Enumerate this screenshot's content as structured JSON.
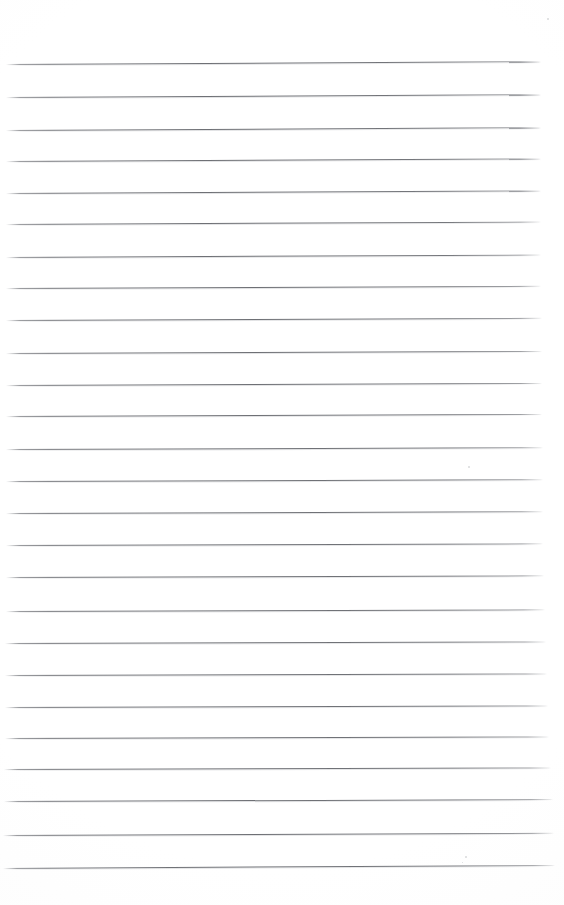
{
  "image": {
    "subject": "blank ruled notebook paper",
    "description": "Scan of an empty sheet of lined writing paper with no text or handwriting",
    "background_color": "#ffffff",
    "rule_color": "#6c6e73",
    "width": 564,
    "height": 905,
    "rule_count": 25,
    "rule_thickness_px": 1,
    "average_line_spacing_px": 32,
    "left_margin_px": 6,
    "right_edge_px": 543,
    "top_margin_px": 64,
    "bottom_margin_px": 39,
    "page_skew_degrees": -0.22,
    "has_margin_rule": false,
    "has_text": false,
    "text_content": ""
  },
  "rules": [
    {
      "index": 1,
      "y": 64,
      "x_start": 6,
      "x_end": 541,
      "skew": -0.3
    },
    {
      "index": 2,
      "y": 97,
      "x_start": 6,
      "x_end": 541,
      "skew": -0.3
    },
    {
      "index": 3,
      "y": 130,
      "x_start": 6,
      "x_end": 541,
      "skew": -0.3
    },
    {
      "index": 4,
      "y": 161,
      "x_start": 6,
      "x_end": 541,
      "skew": -0.28
    },
    {
      "index": 5,
      "y": 193,
      "x_start": 6,
      "x_end": 541,
      "skew": -0.28
    },
    {
      "index": 6,
      "y": 224,
      "x_start": 6,
      "x_end": 541,
      "skew": -0.26
    },
    {
      "index": 7,
      "y": 257,
      "x_start": 6,
      "x_end": 541,
      "skew": -0.26
    },
    {
      "index": 8,
      "y": 288,
      "x_start": 6,
      "x_end": 541,
      "skew": -0.24
    },
    {
      "index": 9,
      "y": 320,
      "x_start": 6,
      "x_end": 542,
      "skew": -0.24
    },
    {
      "index": 10,
      "y": 353,
      "x_start": 6,
      "x_end": 542,
      "skew": -0.22
    },
    {
      "index": 11,
      "y": 385,
      "x_start": 6,
      "x_end": 542,
      "skew": -0.22
    },
    {
      "index": 12,
      "y": 416,
      "x_start": 6,
      "x_end": 542,
      "skew": -0.22
    },
    {
      "index": 13,
      "y": 449,
      "x_start": 6,
      "x_end": 543,
      "skew": -0.2
    },
    {
      "index": 14,
      "y": 481,
      "x_start": 6,
      "x_end": 543,
      "skew": -0.2
    },
    {
      "index": 15,
      "y": 513,
      "x_start": 6,
      "x_end": 543,
      "skew": -0.2
    },
    {
      "index": 16,
      "y": 545,
      "x_start": 6,
      "x_end": 543,
      "skew": -0.18
    },
    {
      "index": 17,
      "y": 577,
      "x_start": 6,
      "x_end": 544,
      "skew": -0.18
    },
    {
      "index": 18,
      "y": 611,
      "x_start": 6,
      "x_end": 545,
      "skew": -0.18
    },
    {
      "index": 19,
      "y": 643,
      "x_start": 5,
      "x_end": 546,
      "skew": -0.16
    },
    {
      "index": 20,
      "y": 675,
      "x_start": 5,
      "x_end": 547,
      "skew": -0.16
    },
    {
      "index": 21,
      "y": 707,
      "x_start": 5,
      "x_end": 548,
      "skew": -0.16
    },
    {
      "index": 22,
      "y": 738,
      "x_start": 5,
      "x_end": 549,
      "skew": -0.16
    },
    {
      "index": 23,
      "y": 769,
      "x_start": 4,
      "x_end": 551,
      "skew": -0.16
    },
    {
      "index": 24,
      "y": 801,
      "x_start": 4,
      "x_end": 553,
      "skew": -0.2
    },
    {
      "index": 25,
      "y": 835,
      "x_start": 3,
      "x_end": 554,
      "skew": -0.24
    },
    {
      "index": 26,
      "y": 868,
      "x_start": 3,
      "x_end": 555,
      "skew": -0.32
    }
  ],
  "specks": [
    {
      "x": 547,
      "y": 18,
      "size": 2
    },
    {
      "x": 468,
      "y": 466,
      "size": 2
    },
    {
      "x": 465,
      "y": 856,
      "size": 2
    },
    {
      "x": 462,
      "y": 862,
      "size": 1
    }
  ]
}
